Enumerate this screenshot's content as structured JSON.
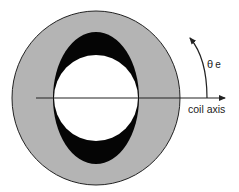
{
  "diagram": {
    "labels": {
      "theta_symbol": "θ",
      "theta_subscript": "e",
      "axis": "coil axis"
    },
    "colors": {
      "outer_ring": "#b4b4b4",
      "ellipse": "#050505",
      "inner_circle": "#ffffff",
      "stroke": "#222222"
    }
  }
}
